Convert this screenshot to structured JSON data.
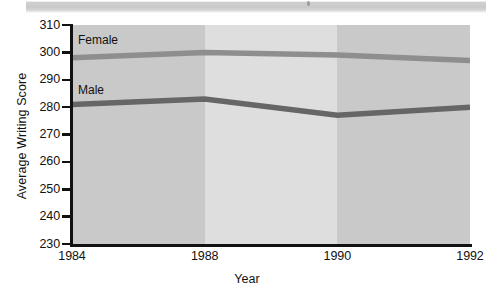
{
  "page": {
    "top_strip": "scan-artifact-strip"
  },
  "chart_data": {
    "type": "line",
    "title": "",
    "xlabel": "Year",
    "ylabel": "Average Writing Score",
    "categories": [
      "1984",
      "1988",
      "1990",
      "1992"
    ],
    "x_tick_labels": [
      "1984",
      "1988",
      "1990",
      "1992"
    ],
    "y_tick_labels": [
      "230",
      "240",
      "250",
      "260",
      "270",
      "280",
      "290",
      "300",
      "310"
    ],
    "ylim": [
      230,
      310
    ],
    "y_step": 10,
    "grid": false,
    "legend": "inline-labels-on-plot",
    "series": [
      {
        "name": "Female",
        "color": "#8e8e8e",
        "values": [
          298,
          300,
          299,
          297
        ]
      },
      {
        "name": "Male",
        "color": "#666666",
        "values": [
          281,
          283,
          277,
          280
        ]
      }
    ],
    "background_bands": [
      {
        "from": "1984",
        "to": "1988",
        "color": "#c9c9c9"
      },
      {
        "from": "1988",
        "to": "1990",
        "color": "#dedede"
      },
      {
        "from": "1990",
        "to": "1992",
        "color": "#c9c9c9"
      }
    ]
  },
  "axes": {
    "y_label": "Average Writing Score",
    "x_label": "Year"
  },
  "series_labels": {
    "female": "Female",
    "male": "Male"
  },
  "colors": {
    "female_line": "#8e8e8e",
    "male_line": "#666666",
    "band_dark": "#c9c9c9",
    "band_light": "#dedede",
    "axis": "#111111",
    "text": "#111111"
  }
}
